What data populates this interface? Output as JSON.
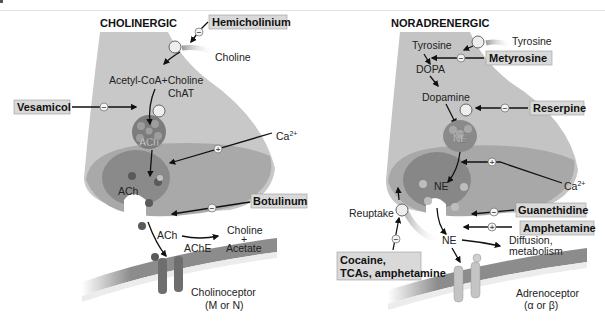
{
  "figure": {
    "panels": [
      {
        "id": "cholinergic",
        "title": "CHOLINERGIC",
        "labels": {
          "choline_in": "Choline",
          "synthesis": "Acetyl-CoA+Choline",
          "enzyme": "ChAT",
          "vesicle": "ACh",
          "calcium": "Ca",
          "calcium_sup": "2+",
          "released": "ACh",
          "cleft_ach": "ACh",
          "degrading_enzyme": "AChE",
          "product_1": "Choline",
          "plus": "+",
          "product_2": "Acetate",
          "receptor": "Cholinoceptor",
          "receptor_type": "(M or N)"
        },
        "drugs": [
          {
            "name": "Hemicholinium",
            "effect": "−"
          },
          {
            "name": "Vesamicol",
            "effect": "−"
          },
          {
            "name": "Botulinum",
            "effect": "−"
          }
        ],
        "calcium_effect": "+"
      },
      {
        "id": "noradrenergic",
        "title": "NORADRENERGIC",
        "labels": {
          "tyrosine_in": "Tyrosine",
          "tyrosine": "Tyrosine",
          "dopa": "DOPA",
          "dopamine": "Dopamine",
          "vesicle": "NE",
          "released": "NE",
          "calcium": "Ca",
          "calcium_sup": "2+",
          "reuptake": "Reuptake",
          "cleft_ne": "NE",
          "diffusion_1": "Diffusion,",
          "diffusion_2": "metabolism",
          "receptor": "Adrenoceptor",
          "receptor_type": "(α or β)"
        },
        "drugs": [
          {
            "name": "Metyrosine",
            "effect": "−"
          },
          {
            "name": "Reserpine",
            "effect": "−"
          },
          {
            "name": "Guanethidine",
            "effect": "−"
          },
          {
            "name": "Amphetamine",
            "effect": "+"
          },
          {
            "name": "Cocaine,",
            "effect": "−"
          },
          {
            "name": "TCAs, amphetamine",
            "effect": "−"
          }
        ],
        "calcium_effect": "+"
      }
    ],
    "colors": {
      "terminal": "#c8c8c8",
      "terminal_lower": "#a8a8a8",
      "vesicle_chol": "#7c7c7c",
      "vesicle_nor": "#8a8a8a",
      "membrane": "#8c8c8c",
      "receptor_chol": "#6e6e6e",
      "receptor_nor": "#c4c4c4",
      "drug_box": "#d9d9d9"
    }
  }
}
